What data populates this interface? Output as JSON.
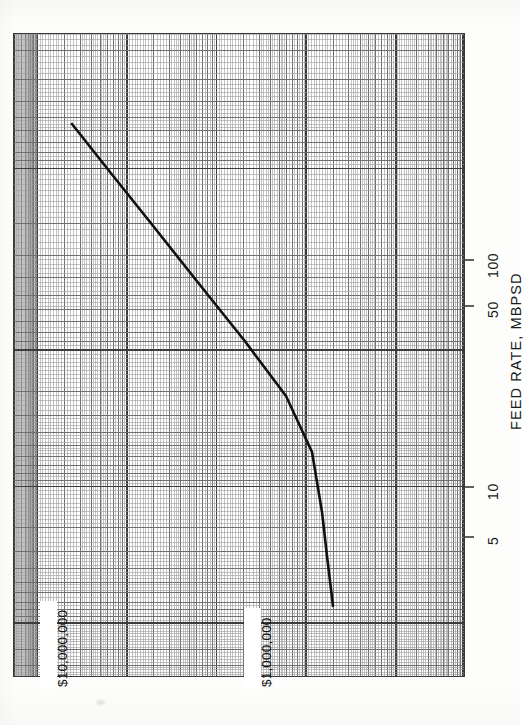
{
  "figure": {
    "kind": "log-log-graph-paper-plot",
    "orientation": "rotated-90-ccw",
    "paper_color": "#fdfdfc",
    "ink_color": "#1a1a1a",
    "grid_color": "#6b6b6b"
  },
  "axis_title": {
    "text": "FEED RATE, MBPSD"
  },
  "feed_ticks": [
    {
      "label": "100",
      "y": 260
    },
    {
      "label": "50",
      "y": 306
    },
    {
      "label": "10",
      "y": 487
    },
    {
      "label": "5",
      "y": 537
    }
  ],
  "cost_labels": [
    {
      "text": "$10,000,000",
      "x": 46,
      "y": 690
    },
    {
      "text": "$1,000,000",
      "x": 250,
      "y": 690
    }
  ],
  "chart_data": {
    "type": "line",
    "title": "",
    "xlabel": "Installed Cost, dollars",
    "ylabel": "FEED RATE, MBPSD",
    "xscale": "log",
    "yscale": "log",
    "grid": true,
    "legend": null,
    "xlim": [
      300000,
      30000000
    ],
    "ylim": [
      2.5,
      400
    ],
    "x_tick_labels": [
      "$1,000,000",
      "$10,000,000"
    ],
    "y_tick_labels": [
      "5",
      "10",
      "50",
      "100"
    ],
    "series": [
      {
        "name": "Installed cost vs feed rate",
        "style": "solid-line",
        "points": [
          {
            "feed_rate_mbpsd": 300,
            "cost_usd": 13500000
          },
          {
            "feed_rate_mbpsd": 200,
            "cost_usd": 10500000
          },
          {
            "feed_rate_mbpsd": 100,
            "cost_usd": 6800000
          },
          {
            "feed_rate_mbpsd": 50,
            "cost_usd": 4300000
          },
          {
            "feed_rate_mbpsd": 20,
            "cost_usd": 2400000
          },
          {
            "feed_rate_mbpsd": 10,
            "cost_usd": 1550000
          },
          {
            "feed_rate_mbpsd": 5,
            "cost_usd": 1000000
          },
          {
            "feed_rate_mbpsd": 3,
            "cost_usd": 720000
          }
        ]
      }
    ]
  }
}
